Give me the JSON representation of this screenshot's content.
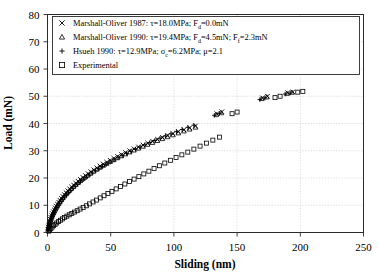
{
  "chart_data": {
    "type": "scatter",
    "title": "",
    "xlabel": "Sliding (nm)",
    "ylabel": "Load (mN)",
    "xlim": [
      0,
      250
    ],
    "ylim": [
      0,
      80
    ],
    "xticks": [
      0,
      50,
      100,
      150,
      200,
      250
    ],
    "yticks": [
      0,
      10,
      20,
      30,
      40,
      50,
      60,
      70,
      80
    ],
    "grid": true,
    "legend_position": "upper-left-inside",
    "series": [
      {
        "name": "Marshall-Oliver 1987",
        "marker": "x",
        "legend_label": "Marshall-Oliver 1987: τ=18.0MPa; Fd=0.0mN",
        "params": {
          "tau": "18.0MPa",
          "Fd": "0.0mN"
        },
        "points": [
          [
            0.4,
            1.2
          ],
          [
            0.7,
            2.0
          ],
          [
            1.0,
            2.7
          ],
          [
            1.4,
            3.4
          ],
          [
            1.8,
            4.1
          ],
          [
            2.3,
            4.8
          ],
          [
            2.8,
            5.5
          ],
          [
            3.4,
            6.2
          ],
          [
            4.0,
            6.9
          ],
          [
            4.7,
            7.6
          ],
          [
            5.4,
            8.3
          ],
          [
            6.2,
            9.0
          ],
          [
            7.0,
            9.7
          ],
          [
            7.9,
            10.4
          ],
          [
            8.9,
            11.1
          ],
          [
            9.9,
            11.8
          ],
          [
            11.0,
            12.5
          ],
          [
            12.2,
            13.2
          ],
          [
            13.4,
            13.9
          ],
          [
            14.7,
            14.6
          ],
          [
            16.1,
            15.3
          ],
          [
            17.6,
            16.0
          ],
          [
            19.1,
            16.7
          ],
          [
            20.7,
            17.4
          ],
          [
            22.4,
            18.1
          ],
          [
            24.2,
            18.8
          ],
          [
            26.0,
            19.5
          ],
          [
            28.0,
            20.2
          ],
          [
            30.0,
            20.9
          ],
          [
            32.1,
            21.6
          ],
          [
            34.3,
            22.3
          ],
          [
            36.6,
            23.0
          ],
          [
            39.0,
            23.7
          ],
          [
            41.5,
            24.4
          ],
          [
            44.1,
            25.1
          ],
          [
            46.8,
            25.8
          ],
          [
            49.6,
            26.5
          ],
          [
            52.5,
            27.2
          ],
          [
            55.5,
            27.9
          ],
          [
            58.6,
            28.6
          ],
          [
            61.8,
            29.3
          ],
          [
            65.1,
            30.0
          ],
          [
            68.5,
            30.7
          ],
          [
            72.0,
            31.4
          ],
          [
            75.6,
            32.1
          ],
          [
            79.3,
            32.8
          ],
          [
            83.1,
            33.5
          ],
          [
            87.0,
            34.2
          ],
          [
            91.0,
            34.9
          ],
          [
            95.1,
            35.6
          ],
          [
            99.3,
            36.3
          ],
          [
            103.6,
            37.0
          ],
          [
            108.0,
            37.7
          ],
          [
            112.5,
            38.4
          ],
          [
            117.1,
            39.1
          ],
          [
            134.0,
            43.6
          ],
          [
            138.0,
            44.3
          ],
          [
            170.0,
            49.4
          ],
          [
            174.0,
            50.0
          ],
          [
            190.0,
            51.3
          ],
          [
            194.0,
            51.6
          ]
        ]
      },
      {
        "name": "Marshall-Oliver 1990",
        "marker": "triangle",
        "legend_label": "Marshall-Oliver 1990: τ=19.4MPa; Fd=4.5mN; Ff=2.3mN",
        "params": {
          "tau": "19.4MPa",
          "Fd": "4.5mN",
          "Ff": "2.3mN"
        },
        "points": [
          [
            0.5,
            1.4
          ],
          [
            0.9,
            2.2
          ],
          [
            1.3,
            2.9
          ],
          [
            1.7,
            3.6
          ],
          [
            2.2,
            4.3
          ],
          [
            2.7,
            5.0
          ],
          [
            3.3,
            5.7
          ],
          [
            3.9,
            6.4
          ],
          [
            4.6,
            7.1
          ],
          [
            5.3,
            7.8
          ],
          [
            6.1,
            8.5
          ],
          [
            6.9,
            9.2
          ],
          [
            7.8,
            9.9
          ],
          [
            8.8,
            10.6
          ],
          [
            9.8,
            11.3
          ],
          [
            10.9,
            12.0
          ],
          [
            12.1,
            12.7
          ],
          [
            13.3,
            13.4
          ],
          [
            14.6,
            14.1
          ],
          [
            16.0,
            14.8
          ],
          [
            17.5,
            15.5
          ],
          [
            19.0,
            16.2
          ],
          [
            20.6,
            16.9
          ],
          [
            22.3,
            17.6
          ],
          [
            24.1,
            18.3
          ],
          [
            25.9,
            19.0
          ],
          [
            27.9,
            19.7
          ],
          [
            29.9,
            20.4
          ],
          [
            32.0,
            21.1
          ],
          [
            34.2,
            21.8
          ],
          [
            36.5,
            22.5
          ],
          [
            38.9,
            23.2
          ],
          [
            41.4,
            23.9
          ],
          [
            44.0,
            24.6
          ],
          [
            46.7,
            25.3
          ],
          [
            49.5,
            26.0
          ],
          [
            52.4,
            26.7
          ],
          [
            55.4,
            27.4
          ],
          [
            58.5,
            28.1
          ],
          [
            61.7,
            28.8
          ],
          [
            65.0,
            29.5
          ],
          [
            68.4,
            30.2
          ],
          [
            71.9,
            30.9
          ],
          [
            75.5,
            31.6
          ],
          [
            79.2,
            32.3
          ],
          [
            83.0,
            33.0
          ],
          [
            86.9,
            33.7
          ],
          [
            90.9,
            34.4
          ],
          [
            95.0,
            35.1
          ],
          [
            99.2,
            35.8
          ],
          [
            103.5,
            36.5
          ],
          [
            107.9,
            37.2
          ],
          [
            112.4,
            37.9
          ],
          [
            117.0,
            38.6
          ],
          [
            133.5,
            43.2
          ],
          [
            137.5,
            43.9
          ],
          [
            169.5,
            49.1
          ],
          [
            173.5,
            49.7
          ],
          [
            189.5,
            51.0
          ],
          [
            193.5,
            51.4
          ]
        ]
      },
      {
        "name": "Hsueh 1990",
        "marker": "plus",
        "legend_label": "Hsueh 1990: τ=12.9MPa; σc=6.2MPa; μ=2.1",
        "params": {
          "tau": "12.9MPa",
          "sigma_c": "6.2MPa",
          "mu": "2.1"
        },
        "points": [
          [
            0.6,
            1.0
          ],
          [
            1.0,
            1.8
          ],
          [
            1.5,
            2.6
          ],
          [
            2.0,
            3.4
          ],
          [
            2.6,
            4.2
          ],
          [
            3.2,
            5.0
          ],
          [
            3.9,
            5.8
          ],
          [
            4.7,
            6.6
          ],
          [
            5.5,
            7.4
          ],
          [
            6.4,
            8.2
          ],
          [
            7.4,
            9.0
          ],
          [
            8.5,
            9.8
          ],
          [
            9.6,
            10.6
          ],
          [
            10.8,
            11.4
          ],
          [
            12.1,
            12.2
          ],
          [
            13.5,
            13.0
          ],
          [
            15.0,
            13.8
          ],
          [
            16.6,
            14.6
          ],
          [
            18.3,
            15.4
          ],
          [
            20.1,
            16.2
          ],
          [
            22.0,
            17.0
          ],
          [
            24.0,
            17.8
          ],
          [
            26.1,
            18.6
          ],
          [
            28.3,
            19.4
          ],
          [
            30.6,
            20.2
          ],
          [
            33.0,
            21.0
          ],
          [
            35.5,
            21.8
          ],
          [
            38.1,
            22.6
          ],
          [
            40.8,
            23.4
          ],
          [
            43.6,
            24.2
          ],
          [
            46.5,
            25.0
          ],
          [
            49.5,
            25.8
          ],
          [
            52.6,
            26.6
          ],
          [
            55.8,
            27.4
          ],
          [
            59.1,
            28.2
          ],
          [
            62.5,
            29.0
          ],
          [
            66.0,
            29.8
          ],
          [
            69.6,
            30.6
          ],
          [
            73.3,
            31.4
          ],
          [
            77.1,
            32.2
          ],
          [
            81.0,
            33.0
          ],
          [
            85.0,
            33.8
          ],
          [
            89.1,
            34.6
          ],
          [
            93.3,
            35.4
          ],
          [
            97.6,
            36.2
          ],
          [
            102.0,
            37.0
          ],
          [
            106.5,
            37.8
          ],
          [
            111.1,
            38.6
          ],
          [
            115.8,
            39.4
          ],
          [
            132.0,
            43.0
          ],
          [
            136.0,
            43.7
          ],
          [
            168.0,
            48.8
          ],
          [
            172.0,
            49.4
          ],
          [
            188.0,
            50.8
          ],
          [
            192.0,
            51.2
          ]
        ]
      },
      {
        "name": "Experimental",
        "marker": "square",
        "legend_label": "Experimental",
        "points": [
          [
            1.0,
            0.5
          ],
          [
            1.8,
            1.0
          ],
          [
            2.7,
            1.5
          ],
          [
            3.7,
            2.0
          ],
          [
            4.8,
            2.5
          ],
          [
            6.0,
            3.0
          ],
          [
            7.3,
            3.5
          ],
          [
            8.7,
            4.0
          ],
          [
            10.2,
            4.5
          ],
          [
            11.8,
            5.0
          ],
          [
            13.5,
            5.5
          ],
          [
            15.3,
            6.0
          ],
          [
            17.2,
            6.5
          ],
          [
            19.2,
            7.0
          ],
          [
            21.3,
            7.5
          ],
          [
            23.5,
            8.0
          ],
          [
            25.8,
            8.6
          ],
          [
            28.2,
            9.2
          ],
          [
            30.7,
            9.8
          ],
          [
            33.3,
            10.5
          ],
          [
            36.0,
            11.2
          ],
          [
            38.8,
            11.9
          ],
          [
            41.7,
            12.7
          ],
          [
            44.7,
            13.5
          ],
          [
            47.8,
            14.3
          ],
          [
            51.0,
            15.1
          ],
          [
            54.3,
            16.0
          ],
          [
            57.7,
            16.9
          ],
          [
            61.2,
            17.8
          ],
          [
            64.8,
            18.7
          ],
          [
            68.5,
            19.6
          ],
          [
            72.3,
            20.5
          ],
          [
            76.2,
            21.5
          ],
          [
            80.2,
            22.5
          ],
          [
            84.3,
            23.5
          ],
          [
            88.5,
            24.5
          ],
          [
            92.8,
            25.5
          ],
          [
            97.2,
            26.5
          ],
          [
            101.7,
            27.5
          ],
          [
            106.3,
            28.5
          ],
          [
            111.0,
            29.5
          ],
          [
            115.8,
            30.6
          ],
          [
            120.7,
            31.7
          ],
          [
            125.7,
            32.8
          ],
          [
            130.8,
            33.9
          ],
          [
            136.0,
            35.0
          ],
          [
            146.0,
            43.6
          ],
          [
            150.0,
            44.2
          ],
          [
            180.0,
            49.5
          ],
          [
            184.0,
            50.0
          ],
          [
            198.0,
            51.5
          ],
          [
            202.0,
            51.8
          ]
        ]
      }
    ]
  },
  "legend": {
    "items": [
      {
        "marker": "x",
        "label": "Marshall-Oliver 1987: τ=18.0MPa; F",
        "sub": "d",
        "tail": "=0.0mN"
      },
      {
        "marker": "triangle",
        "label": "Marshall-Oliver 1990: τ=19.4MPa; F",
        "sub": "d",
        "tail": "=4.5mN; F",
        "sub2": "f",
        "tail2": "=2.3mN"
      },
      {
        "marker": "plus",
        "label": "Hsueh 1990: τ=12.9MPa; σ",
        "sub": "c",
        "tail": "=6.2MPa; μ=2.1"
      },
      {
        "marker": "square",
        "label": "Experimental"
      }
    ]
  },
  "colors": {
    "marker": "#000000",
    "frame": "#2b2b2b",
    "grid": "#c9c9c9",
    "background": "#ffffff"
  }
}
